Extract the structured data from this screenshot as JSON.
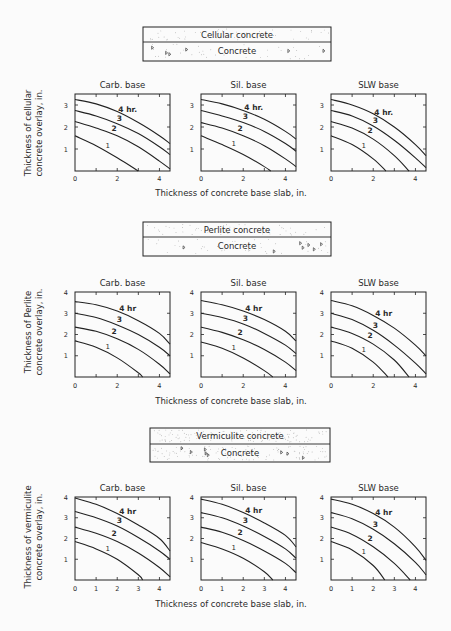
{
  "page": {
    "background": "#fbfbfb",
    "ink": "#222222"
  },
  "sections": [
    {
      "legend": {
        "top_label": "Cellular concrete",
        "bottom_label": "Concrete"
      },
      "ylabel_line1": "Thickness of cellular",
      "ylabel_line2": "concrete overlay, in.",
      "xlabel": "Thickness of concrete base slab, in."
    },
    {
      "legend": {
        "top_label": "Perlite concrete",
        "bottom_label": "Concrete"
      },
      "ylabel_line1": "Thickness of Perlite",
      "ylabel_line2": "concrete overlay, in.",
      "xlabel": "Thickness of concrete base slab, in."
    },
    {
      "legend": {
        "top_label": "Vermiculite concrete",
        "bottom_label": "Concrete"
      },
      "ylabel_line1": "Thickness of vermiculite",
      "ylabel_line2": "concrete overlay, in.",
      "xlabel": "Thickness of concrete base slab, in."
    }
  ],
  "chart_data": [
    {
      "type": "line",
      "title": "Cellular concrete / Carb. base",
      "xlabel": "Thickness of concrete base slab, in.",
      "ylabel": "Thickness of cellular concrete overlay, in.",
      "xlim": [
        0,
        4.5
      ],
      "ylim": [
        0,
        3.5
      ],
      "xticks": [
        0,
        2,
        4
      ],
      "yticks": [
        1,
        2,
        3
      ],
      "series": [
        {
          "name": "1",
          "x": [
            0,
            1,
            2,
            3.0
          ],
          "y": [
            1.6,
            1.15,
            0.6,
            0
          ]
        },
        {
          "name": "2",
          "x": [
            0,
            1,
            2,
            3,
            4,
            4.5
          ],
          "y": [
            2.25,
            1.95,
            1.6,
            1.1,
            0.45,
            0.1
          ]
        },
        {
          "name": "3",
          "x": [
            0,
            1,
            2,
            3,
            4,
            4.5
          ],
          "y": [
            2.75,
            2.5,
            2.15,
            1.7,
            1.1,
            0.75
          ]
        },
        {
          "name": "4 hr.",
          "x": [
            0,
            1,
            2,
            3,
            4,
            4.5
          ],
          "y": [
            3.25,
            3.05,
            2.7,
            2.2,
            1.6,
            1.25
          ]
        }
      ]
    },
    {
      "type": "line",
      "title": "Cellular concrete / Sil. base",
      "xlabel": "Thickness of concrete base slab, in.",
      "ylabel": "Thickness of cellular concrete overlay, in.",
      "xlim": [
        0,
        4.5
      ],
      "ylim": [
        0,
        3.5
      ],
      "xticks": [
        0,
        2,
        4
      ],
      "yticks": [
        1,
        2,
        3
      ],
      "series": [
        {
          "name": "1",
          "x": [
            0,
            1,
            2,
            3,
            3.3
          ],
          "y": [
            1.6,
            1.2,
            0.75,
            0.2,
            0
          ]
        },
        {
          "name": "2",
          "x": [
            0,
            1,
            2,
            3,
            4,
            4.5
          ],
          "y": [
            2.2,
            1.95,
            1.6,
            1.15,
            0.55,
            0.2
          ]
        },
        {
          "name": "3",
          "x": [
            0,
            1,
            2,
            3,
            4,
            4.5
          ],
          "y": [
            2.75,
            2.5,
            2.2,
            1.8,
            1.25,
            0.9
          ]
        },
        {
          "name": "4 hr.",
          "x": [
            0,
            1,
            2,
            3,
            4,
            4.5
          ],
          "y": [
            3.25,
            3.05,
            2.75,
            2.35,
            1.8,
            1.45
          ]
        }
      ]
    },
    {
      "type": "line",
      "title": "Cellular concrete / SLW base",
      "xlabel": "Thickness of concrete base slab, in.",
      "ylabel": "Thickness of cellular concrete overlay, in.",
      "xlim": [
        0,
        4.5
      ],
      "ylim": [
        0,
        3.5
      ],
      "xticks": [
        0,
        2,
        4
      ],
      "yticks": [
        1,
        2,
        3
      ],
      "series": [
        {
          "name": "1",
          "x": [
            0,
            1,
            2,
            2.6
          ],
          "y": [
            1.6,
            1.2,
            0.55,
            0
          ]
        },
        {
          "name": "2",
          "x": [
            0,
            1,
            2,
            3,
            3.7
          ],
          "y": [
            2.25,
            1.95,
            1.45,
            0.7,
            0
          ]
        },
        {
          "name": "3",
          "x": [
            0,
            1,
            2,
            3,
            4,
            4.5
          ],
          "y": [
            2.75,
            2.5,
            2.05,
            1.4,
            0.6,
            0.15
          ]
        },
        {
          "name": "4 hr.",
          "x": [
            0,
            1,
            2,
            3,
            4,
            4.5
          ],
          "y": [
            3.25,
            3.0,
            2.6,
            2.0,
            1.2,
            0.7
          ]
        }
      ]
    },
    {
      "type": "line",
      "title": "Perlite concrete / Carb. base",
      "xlabel": "Thickness of concrete base slab, in.",
      "ylabel": "Thickness of Perlite concrete overlay, in.",
      "xlim": [
        0,
        4.5
      ],
      "ylim": [
        0,
        4
      ],
      "xticks": [
        0,
        2,
        4
      ],
      "yticks": [
        1,
        2,
        3,
        4
      ],
      "series": [
        {
          "name": "1",
          "x": [
            0,
            1,
            2,
            3,
            3.2
          ],
          "y": [
            1.7,
            1.4,
            0.9,
            0.2,
            0
          ]
        },
        {
          "name": "2",
          "x": [
            0,
            1,
            2,
            3,
            4,
            4.5
          ],
          "y": [
            2.35,
            2.15,
            1.8,
            1.3,
            0.6,
            0.15
          ]
        },
        {
          "name": "3",
          "x": [
            0,
            1,
            2,
            3,
            4,
            4.5
          ],
          "y": [
            3.0,
            2.8,
            2.45,
            2.0,
            1.4,
            1.0
          ]
        },
        {
          "name": "4 hr",
          "x": [
            0,
            1,
            2,
            3,
            4,
            4.5
          ],
          "y": [
            3.55,
            3.4,
            3.1,
            2.65,
            2.05,
            1.55
          ]
        }
      ]
    },
    {
      "type": "line",
      "title": "Perlite concrete / Sil. base",
      "xlabel": "Thickness of concrete base slab, in.",
      "ylabel": "Thickness of Perlite concrete overlay, in.",
      "xlim": [
        0,
        4.5
      ],
      "ylim": [
        0,
        4
      ],
      "xticks": [
        0,
        2,
        4
      ],
      "yticks": [
        1,
        2,
        3,
        4
      ],
      "series": [
        {
          "name": "1",
          "x": [
            0,
            1,
            2,
            3,
            3.4
          ],
          "y": [
            1.65,
            1.35,
            0.9,
            0.3,
            0
          ]
        },
        {
          "name": "2",
          "x": [
            0,
            1,
            2,
            3,
            4,
            4.5
          ],
          "y": [
            2.35,
            2.1,
            1.75,
            1.3,
            0.7,
            0.3
          ]
        },
        {
          "name": "3",
          "x": [
            0,
            1,
            2,
            3,
            4,
            4.5
          ],
          "y": [
            3.0,
            2.8,
            2.5,
            2.05,
            1.5,
            1.1
          ]
        },
        {
          "name": "4 hr",
          "x": [
            0,
            1,
            2,
            3,
            4,
            4.5
          ],
          "y": [
            3.6,
            3.4,
            3.1,
            2.7,
            2.15,
            1.7
          ]
        }
      ]
    },
    {
      "type": "line",
      "title": "Perlite concrete / SLW base",
      "xlabel": "Thickness of concrete base slab, in.",
      "ylabel": "Thickness of Perlite concrete overlay, in.",
      "xlim": [
        0,
        4.5
      ],
      "ylim": [
        0,
        4
      ],
      "xticks": [
        0,
        2,
        4
      ],
      "yticks": [
        1,
        2,
        3,
        4
      ],
      "series": [
        {
          "name": "1",
          "x": [
            0,
            1,
            2,
            2.7
          ],
          "y": [
            1.7,
            1.35,
            0.7,
            0
          ]
        },
        {
          "name": "2",
          "x": [
            0,
            1,
            2,
            3,
            3.7
          ],
          "y": [
            2.35,
            2.05,
            1.55,
            0.8,
            0
          ]
        },
        {
          "name": "3",
          "x": [
            0,
            1,
            2,
            3,
            4,
            4.5
          ],
          "y": [
            3.0,
            2.7,
            2.2,
            1.5,
            0.65,
            0.15
          ]
        },
        {
          "name": "4 hr",
          "x": [
            0,
            1,
            2,
            3,
            4,
            4.5
          ],
          "y": [
            3.6,
            3.35,
            2.9,
            2.3,
            1.5,
            1.0
          ]
        }
      ]
    },
    {
      "type": "line",
      "title": "Vermiculite concrete / Carb. base",
      "xlabel": "Thickness of concrete base slab, in.",
      "ylabel": "Thickness of vermiculite concrete overlay, in.",
      "xlim": [
        0,
        4.5
      ],
      "ylim": [
        0,
        4
      ],
      "xticks": [
        0,
        1,
        2,
        3,
        4
      ],
      "yticks": [
        1,
        2,
        3,
        4
      ],
      "series": [
        {
          "name": "1",
          "x": [
            0,
            1,
            2,
            3,
            3.2
          ],
          "y": [
            1.85,
            1.5,
            1.0,
            0.25,
            0
          ]
        },
        {
          "name": "2",
          "x": [
            0,
            1,
            2,
            3,
            4,
            4.5
          ],
          "y": [
            2.55,
            2.25,
            1.85,
            1.3,
            0.6,
            0.15
          ]
        },
        {
          "name": "3",
          "x": [
            0,
            1,
            2,
            3,
            4,
            4.5
          ],
          "y": [
            3.3,
            3.0,
            2.6,
            2.05,
            1.4,
            1.0
          ]
        },
        {
          "name": "4 hr",
          "x": [
            0,
            1,
            2,
            3,
            4,
            4.5
          ],
          "y": [
            3.95,
            3.65,
            3.2,
            2.65,
            2.0,
            1.4
          ]
        }
      ]
    },
    {
      "type": "line",
      "title": "Vermiculite concrete / Sil. base",
      "xlabel": "Thickness of concrete base slab, in.",
      "ylabel": "Thickness of vermiculite concrete overlay, in.",
      "xlim": [
        0,
        4.5
      ],
      "ylim": [
        0,
        4
      ],
      "xticks": [
        0,
        1,
        2,
        3,
        4
      ],
      "yticks": [
        1,
        2,
        3,
        4
      ],
      "series": [
        {
          "name": "1",
          "x": [
            0,
            1,
            2,
            3,
            3.4
          ],
          "y": [
            1.8,
            1.5,
            1.05,
            0.4,
            0
          ]
        },
        {
          "name": "2",
          "x": [
            0,
            1,
            2,
            3,
            4,
            4.5
          ],
          "y": [
            2.55,
            2.3,
            1.9,
            1.4,
            0.8,
            0.35
          ]
        },
        {
          "name": "3",
          "x": [
            0,
            1,
            2,
            3,
            4,
            4.5
          ],
          "y": [
            3.25,
            3.0,
            2.6,
            2.1,
            1.5,
            1.05
          ]
        },
        {
          "name": "4 hr",
          "x": [
            0,
            1,
            2,
            3,
            4,
            4.5
          ],
          "y": [
            3.9,
            3.65,
            3.25,
            2.75,
            2.15,
            1.6
          ]
        }
      ]
    },
    {
      "type": "line",
      "title": "Vermiculite concrete / SLW base",
      "xlabel": "Thickness of concrete base slab, in.",
      "ylabel": "Thickness of vermiculite concrete overlay, in.",
      "xlim": [
        0,
        4.5
      ],
      "ylim": [
        0,
        4
      ],
      "xticks": [
        0,
        1,
        2,
        3,
        4
      ],
      "yticks": [
        1,
        2,
        3,
        4
      ],
      "series": [
        {
          "name": "1",
          "x": [
            0,
            1,
            2,
            2.55
          ],
          "y": [
            1.85,
            1.45,
            0.7,
            0
          ]
        },
        {
          "name": "2",
          "x": [
            0,
            1,
            2,
            3,
            3.75
          ],
          "y": [
            2.55,
            2.2,
            1.6,
            0.8,
            0
          ]
        },
        {
          "name": "3",
          "x": [
            0,
            1,
            2,
            3,
            4,
            4.5
          ],
          "y": [
            3.25,
            2.95,
            2.45,
            1.75,
            0.85,
            0.25
          ]
        },
        {
          "name": "4 hr",
          "x": [
            0,
            1,
            2,
            3,
            4,
            4.5
          ],
          "y": [
            3.9,
            3.65,
            3.2,
            2.55,
            1.6,
            0.95
          ]
        }
      ]
    }
  ],
  "panel_titles": [
    "Carb. base",
    "Sil. base",
    "SLW base"
  ]
}
